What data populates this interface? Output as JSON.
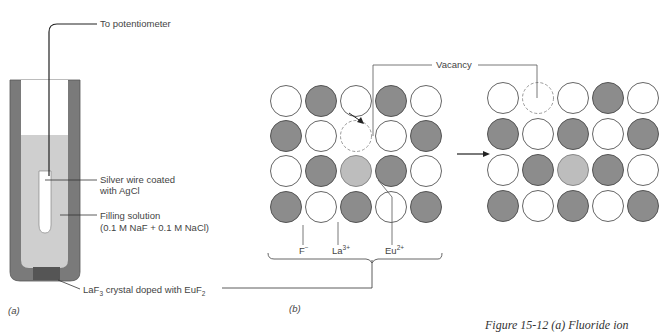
{
  "panel_a": {
    "label": "(a)",
    "top_label": "To potentiometer",
    "wire_label_1": "Silver wire coated",
    "wire_label_2": "with AgCl",
    "filling_label_1": "Filling solution",
    "filling_label_2": "(0.1 M NaF + 0.1 M NaCl)",
    "crystal_label_pre": "LaF",
    "crystal_label_sub1": "3",
    "crystal_label_mid": " crystal doped with EuF",
    "crystal_label_sub2": "2"
  },
  "panel_b": {
    "label": "(b)",
    "vacancy_label": "Vacancy",
    "ion_f": "F",
    "ion_f_sup": "−",
    "ion_la": "La",
    "ion_la_sup": "3+",
    "ion_eu": "Eu",
    "ion_eu_sup": "2+",
    "left_grid": [
      [
        "W",
        "D",
        "W",
        "D",
        "W"
      ],
      [
        "D",
        "W",
        "V",
        "W",
        "D"
      ],
      [
        "W",
        "D",
        "E",
        "D",
        "W"
      ],
      [
        "D",
        "W",
        "D",
        "W",
        "D"
      ]
    ],
    "right_grid": [
      [
        "W",
        "V",
        "W",
        "D",
        "W"
      ],
      [
        "D",
        "W",
        "D",
        "W",
        "D"
      ],
      [
        "W",
        "D",
        "E",
        "D",
        "W"
      ],
      [
        "D",
        "W",
        "D",
        "W",
        "D"
      ]
    ]
  },
  "caption_fragment": "Figure 15-12 (a) Fluoride ion",
  "colors": {
    "dark": "#8c8c8c",
    "light": "#bdbdbd",
    "solution": "#cfcfcf",
    "body": "#7a7a7a",
    "crystal": "#555555"
  }
}
